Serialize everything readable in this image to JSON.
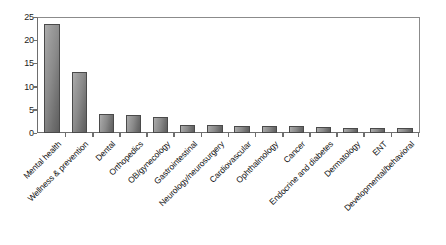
{
  "chart_data": {
    "type": "bar",
    "title": "",
    "subtitle": "",
    "xlabel": "",
    "ylabel": "",
    "ylim": [
      0,
      25
    ],
    "yticks": [
      0,
      5,
      10,
      15,
      20,
      25
    ],
    "grid": false,
    "legend": false,
    "bar_color": "#8a8a8a",
    "categories": [
      "Mental health",
      "Wellness & prevention",
      "Dental",
      "Orthopedics",
      "OB/gynecology",
      "Gastrointestinal",
      "Neurology/neurosurgery",
      "Cardiovascular",
      "Ophthalmology",
      "Cancer",
      "Endocrine and diabetes",
      "Dermatology",
      "ENT",
      "Developmental/behavioral"
    ],
    "values": [
      23.5,
      13.2,
      4.1,
      3.9,
      3.4,
      1.7,
      1.7,
      1.6,
      1.6,
      1.5,
      1.4,
      1.1,
      1.1,
      1.0
    ]
  }
}
